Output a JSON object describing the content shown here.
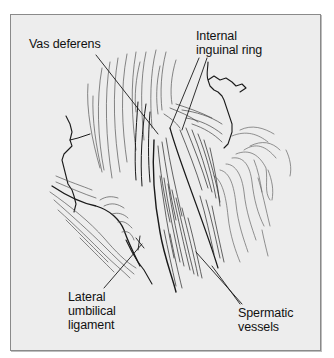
{
  "figure": {
    "type": "anatomical line drawing",
    "colors": {
      "background": "#ededed",
      "border": "#8a8a8a",
      "ink": "#111111"
    }
  },
  "labels": {
    "vas_deferens": "Vas deferens",
    "internal_inguinal_ring": "Internal\ninguinal ring",
    "lateral_umbilical_ligament": "Lateral\numbilical\nligament",
    "spermatic_vessels": "Spermatic\nvessels"
  }
}
